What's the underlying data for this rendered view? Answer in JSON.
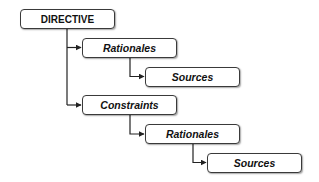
{
  "diagram": {
    "type": "hierarchy-tree",
    "nodes": [
      {
        "id": "directive",
        "label": "DIRECTIVE",
        "level": 0,
        "style": "bold"
      },
      {
        "id": "rationales-1",
        "label": "Rationales",
        "level": 1,
        "parent": "directive",
        "style": "bold-italic"
      },
      {
        "id": "sources-1",
        "label": "Sources",
        "level": 2,
        "parent": "rationales-1",
        "style": "bold-italic"
      },
      {
        "id": "constraints",
        "label": "Constraints",
        "level": 1,
        "parent": "directive",
        "style": "bold-italic"
      },
      {
        "id": "rationales-2",
        "label": "Rationales",
        "level": 2,
        "parent": "constraints",
        "style": "bold-italic"
      },
      {
        "id": "sources-2",
        "label": "Sources",
        "level": 3,
        "parent": "rationales-2",
        "style": "bold-italic"
      }
    ],
    "edges": [
      {
        "from": "directive",
        "to": "rationales-1"
      },
      {
        "from": "rationales-1",
        "to": "sources-1"
      },
      {
        "from": "directive",
        "to": "constraints"
      },
      {
        "from": "constraints",
        "to": "rationales-2"
      },
      {
        "from": "rationales-2",
        "to": "sources-2"
      }
    ],
    "colors": {
      "stroke": "#3a3a3a",
      "background": "#ffffff",
      "text": "#111111"
    }
  }
}
